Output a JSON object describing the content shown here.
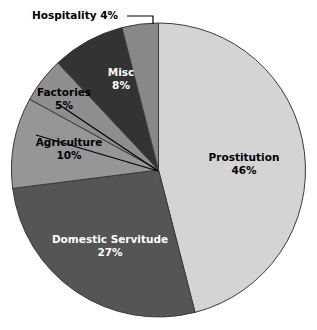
{
  "chart_data": {
    "type": "pie",
    "title": "",
    "subtitle": "",
    "xlabel": "",
    "ylabel": "",
    "legend_position": "none",
    "grid": false,
    "value_unit": "%",
    "start_angle_deg": 0,
    "direction": "clockwise",
    "categories": [
      "Prostitution",
      "Domestic Servitude",
      "Agriculture",
      "Factories",
      "Misc",
      "Hospitality"
    ],
    "values": [
      46,
      27,
      10,
      5,
      8,
      4
    ],
    "slices": [
      {
        "label": "Prostitution",
        "value": 46,
        "value_text": "46%",
        "color": "#d4d4d4",
        "label_color": "#000000",
        "label_placement": "inside"
      },
      {
        "label": "Domestic Servitude",
        "value": 27,
        "value_text": "27%",
        "color": "#555555",
        "label_color": "#ffffff",
        "label_placement": "inside"
      },
      {
        "label": "Agriculture",
        "value": 10,
        "value_text": "10%",
        "color": "#969696",
        "label_color": "#000000",
        "label_placement": "outside-leader"
      },
      {
        "label": "Factories",
        "value": 5,
        "value_text": "5%",
        "color": "#8e8e8e",
        "label_color": "#000000",
        "label_placement": "outside-leader"
      },
      {
        "label": "Misc",
        "value": 8,
        "value_text": "8%",
        "color": "#333333",
        "label_color": "#ffffff",
        "label_placement": "inside"
      },
      {
        "label": "Hospitality",
        "value": 4,
        "value_text": "4%",
        "color": "#888888",
        "label_color": "#000000",
        "label_placement": "outside-callout"
      }
    ],
    "callouts": [
      {
        "text": "Hospitality 4%",
        "for_slice": "Hospitality"
      }
    ]
  },
  "labels": {
    "prostitution_name": "Prostitution",
    "prostitution_value": "46%",
    "domestic_servitude_name": "Domestic Servitude",
    "domestic_servitude_value": "27%",
    "agriculture_name": "Agriculture",
    "agriculture_value": "10%",
    "factories_name": "Factories",
    "factories_value": "5%",
    "misc_name": "Misc",
    "misc_value": "8%",
    "hospitality_callout": "Hospitality 4%"
  }
}
